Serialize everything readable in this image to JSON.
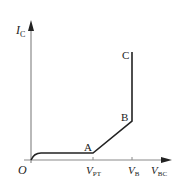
{
  "diagram": {
    "type": "transistor-characteristic-curve",
    "y_axis": {
      "symbol": "I",
      "subscript": "C"
    },
    "x_axis": {
      "symbol": "V",
      "subscript": "BC"
    },
    "origin_label": "O",
    "ticks": [
      {
        "symbol": "V",
        "subscript": "PT"
      },
      {
        "symbol": "V",
        "subscript": "B"
      }
    ],
    "points": [
      {
        "label": "A"
      },
      {
        "label": "B"
      },
      {
        "label": "C"
      }
    ],
    "colors": {
      "axis": "#8a8a8a",
      "curve": "#222222",
      "text": "#222222"
    }
  }
}
